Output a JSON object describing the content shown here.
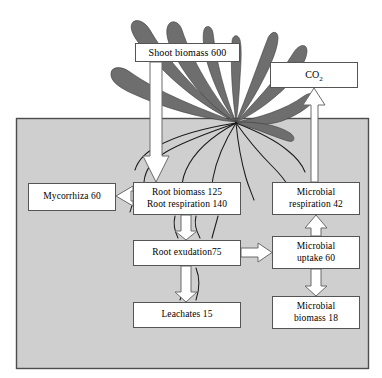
{
  "diagram": {
    "colors": {
      "soil_fill": "#cfcfcf",
      "soil_stroke": "#4d4d4d",
      "leaf_fill": "#6e6e6e",
      "box_fill": "#ffffff",
      "box_stroke": "#555555",
      "arrow_fill": "#ffffff",
      "arrow_stroke": "#666666",
      "root_stroke": "#1a1a1a",
      "background": "#ffffff"
    },
    "regions": [
      {
        "name": "soil",
        "label": ""
      }
    ],
    "nodes": [
      {
        "id": "shoot",
        "label": "Shoot biomass 600",
        "value": 600
      },
      {
        "id": "co2",
        "label": "CO",
        "subscript": "2",
        "value": null
      },
      {
        "id": "mycorrhiza",
        "label": "Mycorrhiza 60",
        "value": 60
      },
      {
        "id": "root_biomass",
        "line1": "Root biomass 125",
        "line2": "Root respiration 140",
        "value": 125,
        "value2": 140
      },
      {
        "id": "microbial_respiration",
        "line1": "Microbial",
        "line2": "respiration 42",
        "value": 42
      },
      {
        "id": "root_exudation",
        "label": "Root exudation75",
        "value": 75
      },
      {
        "id": "microbial_uptake",
        "line1": "Microbial",
        "line2": "uptake 60",
        "value": 60
      },
      {
        "id": "leachates",
        "label": "Leachates 15",
        "value": 15
      },
      {
        "id": "microbial_biomass",
        "line1": "Microbial",
        "line2": "biomass 18",
        "value": 18
      }
    ],
    "flows": [
      {
        "from": "shoot",
        "to": "root_biomass",
        "style": "block-arrow",
        "direction": "down"
      },
      {
        "from": "root_biomass",
        "to": "mycorrhiza",
        "style": "block-arrow",
        "direction": "left"
      },
      {
        "from": "root_biomass",
        "to": "root_exudation",
        "style": "block-arrow",
        "direction": "down"
      },
      {
        "from": "root_exudation",
        "to": "leachates",
        "style": "block-arrow",
        "direction": "down"
      },
      {
        "from": "root_exudation",
        "to": "microbial_uptake",
        "style": "block-arrow",
        "direction": "right"
      },
      {
        "from": "microbial_uptake",
        "to": "microbial_respiration",
        "style": "block-arrow",
        "direction": "up"
      },
      {
        "from": "microbial_uptake",
        "to": "microbial_biomass",
        "style": "block-arrow",
        "direction": "down"
      },
      {
        "from": "microbial_respiration",
        "to": "co2",
        "style": "block-arrow",
        "direction": "up"
      }
    ]
  }
}
